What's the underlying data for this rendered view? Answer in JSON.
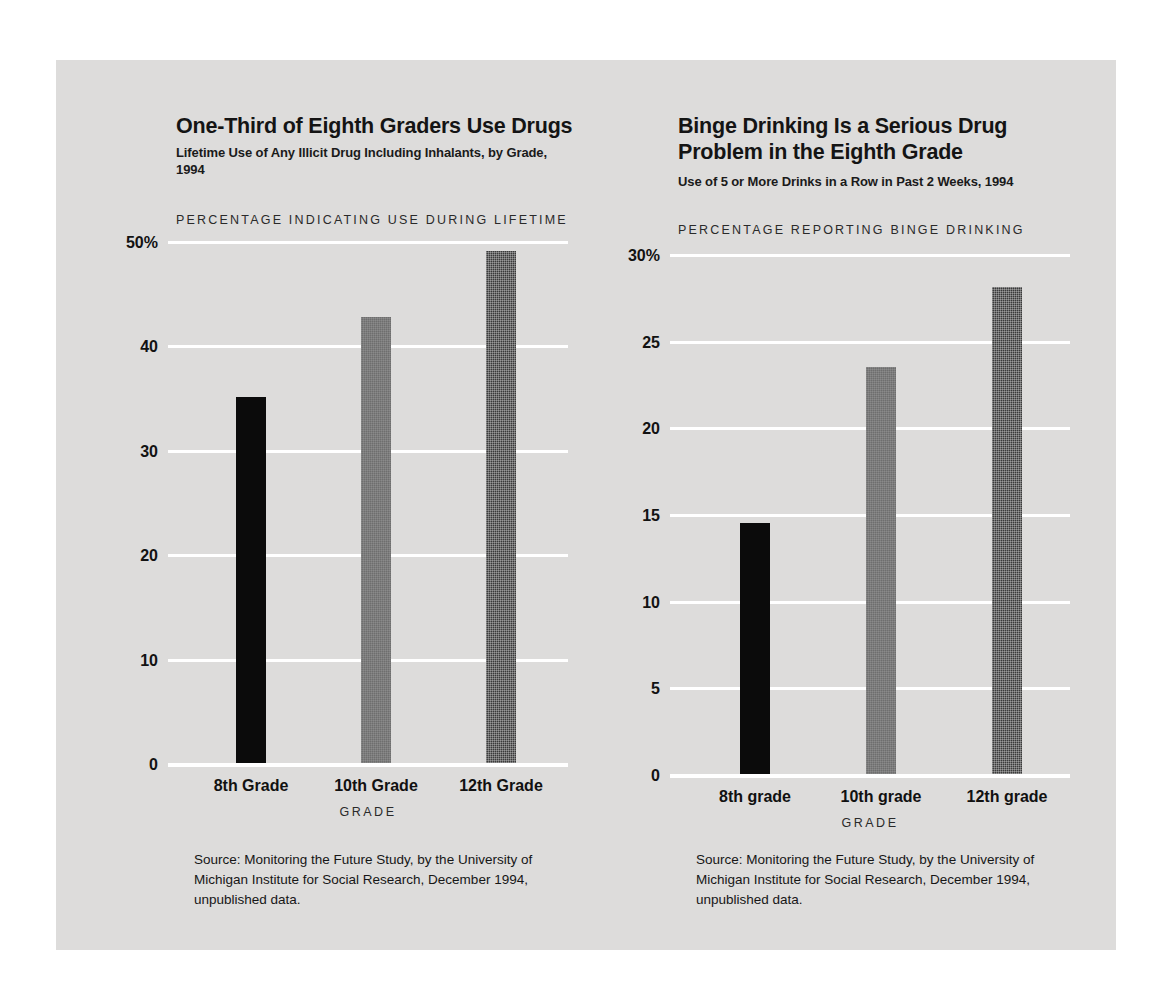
{
  "page": {
    "background_color": "#ffffff",
    "panel_color": "#dddcdb",
    "gridline_color": "#ffffff"
  },
  "charts": [
    {
      "id": "illicit-drug-use",
      "title": "One-Third of Eighth Graders Use Drugs",
      "subtitle": "Lifetime Use of Any Illicit Drug Including Inhalants, by Grade, 1994",
      "axis_caption": "PERCENTAGE INDICATING USE DURING LIFETIME",
      "xlabel": "GRADE",
      "source": "Source: Monitoring the Future Study, by the University of Michigan Institute for Social Research, December 1994, unpublished data.",
      "yticks": [
        "50%",
        "40",
        "30",
        "20",
        "10",
        "0"
      ],
      "categories": [
        "8th Grade",
        "10th Grade",
        "12th Grade"
      ]
    },
    {
      "id": "binge-drinking",
      "title": "Binge Drinking Is a Serious Drug Problem in the Eighth Grade",
      "subtitle": "Use of 5 or More Drinks in a Row in Past 2 Weeks, 1994",
      "axis_caption": "PERCENTAGE REPORTING BINGE DRINKING",
      "xlabel": "GRADE",
      "source": "Source: Monitoring the Future Study, by the University of Michigan Institute for Social Research, December 1994, unpublished data.",
      "yticks": [
        "30%",
        "25",
        "20",
        "15",
        "10",
        "5",
        "0"
      ],
      "categories": [
        "8th grade",
        "10th grade",
        "12th grade"
      ]
    }
  ],
  "chart_data": [
    {
      "type": "bar",
      "title": "One-Third of Eighth Graders Use Drugs",
      "subtitle": "Lifetime Use of Any Illicit Drug Including Inhalants, by Grade, 1994",
      "xlabel": "GRADE",
      "ylabel": "PERCENTAGE INDICATING USE DURING LIFETIME",
      "categories": [
        "8th Grade",
        "10th Grade",
        "12th Grade"
      ],
      "values": [
        35.1,
        42.7,
        49.0
      ],
      "ylim": [
        0,
        50
      ],
      "yticks": [
        0,
        10,
        20,
        30,
        40,
        50
      ],
      "ytick_labels": [
        "0",
        "10",
        "20",
        "30",
        "40",
        "50%"
      ],
      "grid": true,
      "legend": "none",
      "bar_colors": [
        "#0b0b0b",
        "#6e6e6e",
        "#3a3a3a"
      ],
      "source": "Source: Monitoring the Future Study, by the University of Michigan Institute for Social Research, December 1994, unpublished data."
    },
    {
      "type": "bar",
      "title": "Binge Drinking Is a Serious Drug Problem in the Eighth Grade",
      "subtitle": "Use of 5 or More Drinks in a Row in Past 2 Weeks, 1994",
      "xlabel": "GRADE",
      "ylabel": "PERCENTAGE REPORTING BINGE DRINKING",
      "categories": [
        "8th grade",
        "10th grade",
        "12th grade"
      ],
      "values": [
        14.5,
        23.5,
        28.1
      ],
      "ylim": [
        0,
        30
      ],
      "yticks": [
        0,
        5,
        10,
        15,
        20,
        25,
        30
      ],
      "ytick_labels": [
        "0",
        "5",
        "10",
        "15",
        "20",
        "25",
        "30%"
      ],
      "grid": true,
      "legend": "none",
      "bar_colors": [
        "#0b0b0b",
        "#6e6e6e",
        "#3a3a3a"
      ],
      "source": "Source: Monitoring the Future Study, by the University of Michigan Institute for Social Research, December 1994, unpublished data."
    }
  ]
}
